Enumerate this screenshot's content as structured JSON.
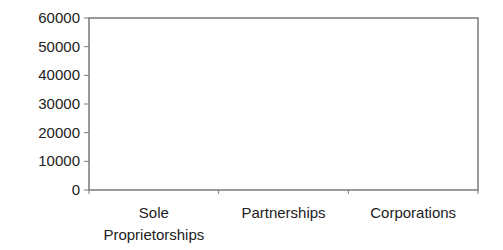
{
  "chart_data": {
    "type": "bar",
    "title": "",
    "xlabel": "",
    "ylabel": "",
    "categories": [
      "Sole Proprietorships",
      "Partnerships",
      "Corporations"
    ],
    "category_label_lines": [
      [
        "Sole",
        "Proprietorships"
      ],
      [
        "Partnerships"
      ],
      [
        "Corporations"
      ]
    ],
    "values": [
      0,
      0,
      0
    ],
    "ylim": [
      0,
      60000
    ],
    "yticks": [
      0,
      10000,
      20000,
      30000,
      40000,
      50000,
      60000
    ],
    "ytick_labels": [
      "0",
      "10000",
      "20000",
      "30000",
      "40000",
      "50000",
      "60000"
    ],
    "grid": false,
    "legend": null,
    "bar_color": "#4f81bd"
  },
  "colors": {
    "frame": "#7a7a7a",
    "text": "#222222",
    "background": "#ffffff"
  }
}
